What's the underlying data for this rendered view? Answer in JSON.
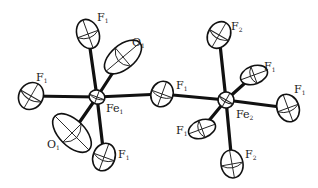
{
  "diagram": {
    "title": "",
    "type": "ORTEP molecular structure",
    "atoms": [
      {
        "id": "Fe1",
        "symbol": "Fe",
        "sub": "1",
        "x": 97,
        "y": 97,
        "rx": 8,
        "ry": 7,
        "rot": 20,
        "lx": 106,
        "ly": 112
      },
      {
        "id": "Fe2",
        "symbol": "Fe",
        "sub": "2",
        "x": 226,
        "y": 100,
        "rx": 8,
        "ry": 8,
        "rot": 30,
        "lx": 236,
        "ly": 118
      },
      {
        "id": "F1_bridge",
        "symbol": "F",
        "sub": "1",
        "x": 162,
        "y": 94,
        "rx": 11,
        "ry": 13,
        "rot": 20,
        "lx": 176,
        "ly": 89
      },
      {
        "id": "F1_left",
        "symbol": "F",
        "sub": "1",
        "x": 31,
        "y": 96,
        "rx": 12,
        "ry": 14,
        "rot": 30,
        "lx": 36,
        "ly": 81
      },
      {
        "id": "F1_top",
        "symbol": "F",
        "sub": "1",
        "x": 88,
        "y": 34,
        "rx": 11,
        "ry": 15,
        "rot": -20,
        "lx": 97,
        "ly": 21
      },
      {
        "id": "O1_top",
        "symbol": "O",
        "sub": "1",
        "x": 123,
        "y": 57,
        "rx": 12,
        "ry": 22,
        "rot": 50,
        "lx": 132,
        "ly": 46
      },
      {
        "id": "O1_bottom",
        "symbol": "O",
        "sub": "1",
        "x": 72,
        "y": 133,
        "rx": 13,
        "ry": 24,
        "rot": -45,
        "lx": 47,
        "ly": 148
      },
      {
        "id": "F1_bottom",
        "symbol": "F",
        "sub": "1",
        "x": 104,
        "y": 157,
        "rx": 11,
        "ry": 14,
        "rot": 20,
        "lx": 118,
        "ly": 158
      },
      {
        "id": "F2_top",
        "symbol": "F",
        "sub": "2",
        "x": 219,
        "y": 35,
        "rx": 11,
        "ry": 14,
        "rot": 30,
        "lx": 231,
        "ly": 30
      },
      {
        "id": "F1_upperright",
        "symbol": "F",
        "sub": "1",
        "x": 254,
        "y": 75,
        "rx": 9,
        "ry": 14,
        "rot": 70,
        "lx": 264,
        "ly": 70
      },
      {
        "id": "F1_right",
        "symbol": "F",
        "sub": "1",
        "x": 288,
        "y": 108,
        "rx": 11,
        "ry": 14,
        "rot": -20,
        "lx": 294,
        "ly": 93
      },
      {
        "id": "F1_lowerleft",
        "symbol": "F",
        "sub": "1",
        "x": 202,
        "y": 129,
        "rx": 9,
        "ry": 14,
        "rot": 70,
        "lx": 176,
        "ly": 134
      },
      {
        "id": "F2_bottom",
        "symbol": "F",
        "sub": "2",
        "x": 232,
        "y": 164,
        "rx": 11,
        "ry": 14,
        "rot": -10,
        "lx": 245,
        "ly": 158
      }
    ],
    "bonds": [
      [
        "Fe1",
        "F1_left"
      ],
      [
        "Fe1",
        "F1_bridge"
      ],
      [
        "Fe1",
        "F1_top"
      ],
      [
        "Fe1",
        "O1_top"
      ],
      [
        "Fe1",
        "O1_bottom"
      ],
      [
        "Fe1",
        "F1_bottom"
      ],
      [
        "F1_bridge",
        "Fe2"
      ],
      [
        "Fe2",
        "F2_top"
      ],
      [
        "Fe2",
        "F1_upperright"
      ],
      [
        "Fe2",
        "F1_right"
      ],
      [
        "Fe2",
        "F1_lowerleft"
      ],
      [
        "Fe2",
        "F2_bottom"
      ]
    ]
  }
}
